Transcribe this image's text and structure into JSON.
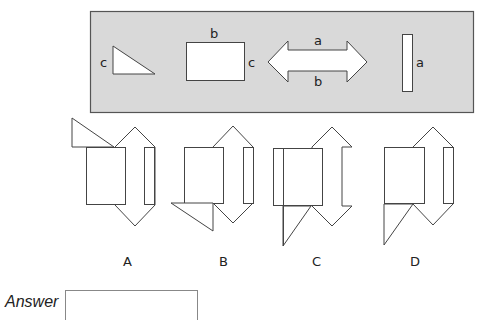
{
  "puzzle": {
    "reference_panel": {
      "background": "#d9d9d9",
      "shapes": [
        {
          "type": "right-triangle",
          "side_label": "c"
        },
        {
          "type": "rectangle",
          "top_label": "b",
          "right_label": "c"
        },
        {
          "type": "double-arrow",
          "top_label": "a",
          "bottom_label": "b"
        },
        {
          "type": "narrow-rectangle",
          "right_label": "a"
        }
      ],
      "labels": {
        "triangle_c": "c",
        "rect_b": "b",
        "rect_c": "c",
        "arrow_a": "a",
        "arrow_b": "b",
        "narrow_a": "a"
      }
    },
    "options": [
      {
        "id": "A",
        "label": "A"
      },
      {
        "id": "B",
        "label": "B"
      },
      {
        "id": "C",
        "label": "C"
      },
      {
        "id": "D",
        "label": "D"
      }
    ],
    "answer": {
      "label": "Answer",
      "value": ""
    }
  }
}
